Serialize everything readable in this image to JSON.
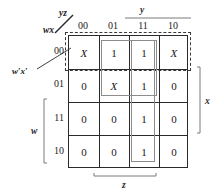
{
  "diagram": {
    "type": "karnaugh-map",
    "variables": [
      "w",
      "x",
      "y",
      "z"
    ],
    "corner_labels": {
      "top_right": "yz",
      "bottom_left": "wx"
    },
    "column_headers": [
      "00",
      "01",
      "11",
      "10"
    ],
    "row_headers": [
      "00",
      "01",
      "11",
      "10"
    ],
    "cells": [
      [
        "X",
        "1",
        "1",
        "X"
      ],
      [
        "0",
        "X",
        "1",
        "0"
      ],
      [
        "0",
        "0",
        "1",
        "0"
      ],
      [
        "0",
        "0",
        "1",
        "0"
      ]
    ],
    "axis_brackets": [
      {
        "name": "y",
        "label": "y",
        "position": "top",
        "spans": [
          "11",
          "10"
        ]
      },
      {
        "name": "z",
        "label": "z",
        "position": "bottom",
        "spans": [
          "01",
          "11"
        ]
      },
      {
        "name": "x",
        "label": "x",
        "position": "right",
        "spans": [
          "01",
          "11"
        ]
      },
      {
        "name": "w",
        "label": "w",
        "position": "left",
        "spans": [
          "11",
          "10"
        ]
      }
    ],
    "annotations": [
      {
        "name": "w-prime-x-prime",
        "label": "w′x′",
        "points_to": "row-00"
      }
    ],
    "groups": [
      {
        "name": "group-w-prime-x-prime",
        "style": "dashed",
        "label": "w′x′",
        "cells": "row 00, all columns"
      },
      {
        "name": "group-yz-quad",
        "style": "solid",
        "label": "",
        "cells": "rows 00-01, columns 01-11"
      },
      {
        "name": "group-y-z-column",
        "style": "solid",
        "label": "",
        "cells": "column 11, all rows"
      }
    ],
    "colors": {
      "grid": "#2a2a2a",
      "group_solid": "#8c8c8c",
      "group_dashed": "#3a3a3a",
      "text": "#1a1a1a",
      "background": "#ffffff"
    }
  }
}
